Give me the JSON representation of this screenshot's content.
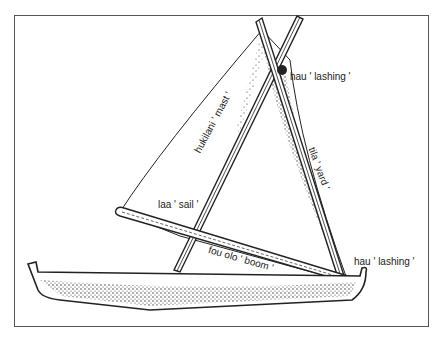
{
  "figure": {
    "labels": {
      "hau_top": "hau ' lashing '",
      "mast": "hukilani ' mast '",
      "yard": "tila ' yard '",
      "sail": "laa ' sail '",
      "boom": "fou olo ' boom '",
      "hau_bottom": "hau ' lashing '"
    }
  },
  "colors": {
    "ink": "#222222",
    "frame": "#555555",
    "background": "#ffffff"
  }
}
